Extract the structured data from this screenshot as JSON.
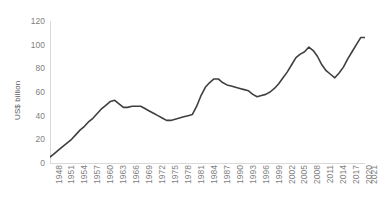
{
  "chart_data": {
    "type": "line",
    "title": "",
    "subtitle": "",
    "xlabel": "",
    "ylabel": "US$ billion",
    "ylim": [
      0,
      120
    ],
    "yticks": [
      0,
      20,
      40,
      60,
      80,
      100,
      120
    ],
    "grid": false,
    "legend": false,
    "legend_position": "none",
    "line_color": "#3f3f3f",
    "axis_color": "#d9d9d9",
    "tick_label_color": "#7f7f7f",
    "x_tick_labels": [
      "1948",
      "1951",
      "1954",
      "1957",
      "1960",
      "1963",
      "1966",
      "1969",
      "1972",
      "1975",
      "1978",
      "1981",
      "1984",
      "1987",
      "1990",
      "1993",
      "1996",
      "1999",
      "2002",
      "2005",
      "2008",
      "2011",
      "2014",
      "2017",
      "2020",
      "2021"
    ],
    "x": [
      1948,
      1949,
      1950,
      1951,
      1952,
      1953,
      1954,
      1955,
      1956,
      1957,
      1958,
      1959,
      1960,
      1961,
      1962,
      1963,
      1964,
      1965,
      1966,
      1967,
      1968,
      1969,
      1970,
      1971,
      1972,
      1973,
      1974,
      1975,
      1976,
      1977,
      1978,
      1979,
      1980,
      1981,
      1982,
      1983,
      1984,
      1985,
      1986,
      1987,
      1988,
      1989,
      1990,
      1991,
      1992,
      1993,
      1994,
      1995,
      1996,
      1997,
      1998,
      1999,
      2000,
      2001,
      2002,
      2003,
      2004,
      2005,
      2006,
      2007,
      2008,
      2009,
      2010,
      2011,
      2012,
      2013,
      2014,
      2015,
      2016,
      2017,
      2018,
      2019,
      2020,
      2021
    ],
    "values": [
      5,
      8,
      11,
      14,
      17,
      20,
      24,
      28,
      31,
      35,
      38,
      42,
      46,
      49,
      52,
      53,
      50,
      47,
      47,
      48,
      48,
      48,
      46,
      44,
      42,
      40,
      38,
      36,
      36,
      37,
      38,
      39,
      40,
      41,
      48,
      57,
      64,
      68,
      71,
      71,
      68,
      66,
      65,
      64,
      63,
      62,
      61,
      58,
      56,
      57,
      58,
      60,
      63,
      67,
      72,
      77,
      83,
      89,
      92,
      94,
      98,
      95,
      90,
      83,
      78,
      75,
      72,
      76,
      81,
      88,
      94,
      100,
      106,
      106
    ],
    "series": [
      {
        "name": "US$ billion",
        "values": [
          5,
          8,
          11,
          14,
          17,
          20,
          24,
          28,
          31,
          35,
          38,
          42,
          46,
          49,
          52,
          53,
          50,
          47,
          47,
          48,
          48,
          48,
          46,
          44,
          42,
          40,
          38,
          36,
          36,
          37,
          38,
          39,
          40,
          41,
          48,
          57,
          64,
          68,
          71,
          71,
          68,
          66,
          65,
          64,
          63,
          62,
          61,
          58,
          56,
          57,
          58,
          60,
          63,
          67,
          72,
          77,
          83,
          89,
          92,
          94,
          98,
          95,
          90,
          83,
          78,
          75,
          72,
          76,
          81,
          88,
          94,
          100,
          106,
          106
        ]
      }
    ],
    "annotations": []
  }
}
